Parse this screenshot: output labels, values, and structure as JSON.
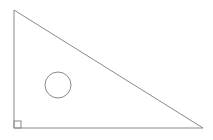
{
  "figure": {
    "background_color": "#ffffff",
    "width": 213,
    "height": 140,
    "stroke_color": "#8a8a8a",
    "base_stroke_color": "#8f8f8f",
    "stroke_width": 1,
    "shapes": {
      "triangle": {
        "label": "right-triangle",
        "type": "polygon",
        "points": "14,10 14,128 203,128",
        "vertices": [
          {
            "name": "apex",
            "x": 14,
            "y": 10
          },
          {
            "name": "bottom-left-right-angle",
            "x": 14,
            "y": 128
          },
          {
            "name": "bottom-right",
            "x": 203,
            "y": 128
          }
        ]
      },
      "circle": {
        "label": "inscribed-circle",
        "type": "circle",
        "cx": 58,
        "cy": 85,
        "r": 13
      },
      "right_angle_marker": {
        "label": "right-angle-marker",
        "type": "square",
        "x": 14,
        "y": 121,
        "size": 7
      }
    }
  }
}
